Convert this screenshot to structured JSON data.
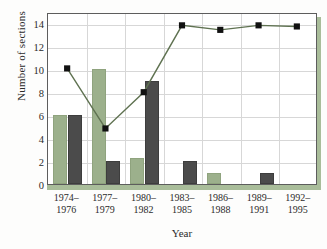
{
  "chart_data": {
    "type": "bar",
    "title": "",
    "xlabel": "Year",
    "ylabel": "Number of sections",
    "categories": [
      "1974–\n1976",
      "1977–\n1979",
      "1980–\n1982",
      "1983–\n1985",
      "1986–\n1988",
      "1989–\n1991",
      "1992–\n1995"
    ],
    "category_lines": [
      [
        "1974–",
        "1976"
      ],
      [
        "1977–",
        "1979"
      ],
      [
        "1980–",
        "1982"
      ],
      [
        "1983–",
        "1985"
      ],
      [
        "1986–",
        "1988"
      ],
      [
        "1989–",
        "1991"
      ],
      [
        "1992–",
        "1995"
      ]
    ],
    "ylim": [
      0,
      15
    ],
    "yticks": [
      0,
      2,
      4,
      6,
      8,
      10,
      12,
      14
    ],
    "ytick_labels": [
      "0",
      "2",
      "4",
      "6",
      "8",
      "10",
      "12",
      "14"
    ],
    "grid": true,
    "legend": "none",
    "series": [
      {
        "name": "green-bars",
        "kind": "bar",
        "color": "#9cb08c",
        "values": [
          6,
          10,
          2.3,
          0,
          1,
          0,
          0
        ]
      },
      {
        "name": "dark-bars",
        "kind": "bar",
        "color": "#4b4b4b",
        "values": [
          6,
          2,
          9,
          2,
          0,
          1,
          0
        ]
      },
      {
        "name": "line-series",
        "kind": "line",
        "color": "#5f7251",
        "marker": "square",
        "marker_color": "#111111",
        "values": [
          10.2,
          4.9,
          8.1,
          14,
          13.6,
          14,
          13.9
        ]
      }
    ]
  }
}
